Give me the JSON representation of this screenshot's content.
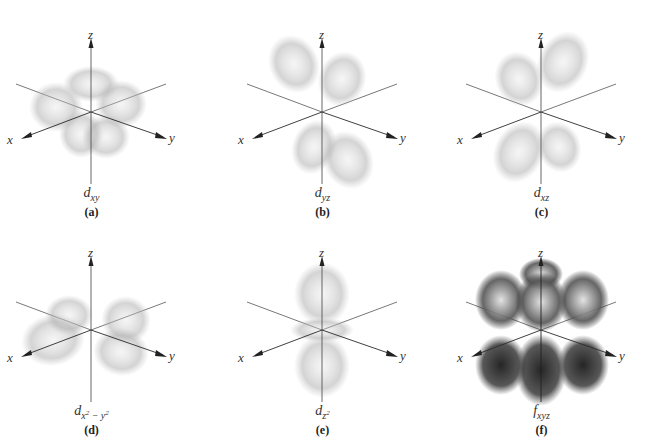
{
  "figure": {
    "axis_labels": {
      "x": "x",
      "y": "y",
      "z": "z"
    },
    "panels": [
      {
        "id": "a",
        "letter": "(a)",
        "orbital": "d",
        "sub": "xy",
        "sup": "",
        "sub2": "",
        "kind": "dxy",
        "col": 0,
        "row": 0
      },
      {
        "id": "b",
        "letter": "(b)",
        "orbital": "d",
        "sub": "yz",
        "sup": "",
        "sub2": "",
        "kind": "dyz",
        "col": 1,
        "row": 0
      },
      {
        "id": "c",
        "letter": "(c)",
        "orbital": "d",
        "sub": "xz",
        "sup": "",
        "sub2": "",
        "kind": "dxz",
        "col": 2,
        "row": 0
      },
      {
        "id": "d",
        "letter": "(d)",
        "orbital": "d",
        "sub": "x",
        "sup": "2",
        "sub2": " − y",
        "sup2": "2",
        "kind": "dx2y2",
        "col": 0,
        "row": 1
      },
      {
        "id": "e",
        "letter": "(e)",
        "orbital": "d",
        "sub": "z",
        "sup": "2",
        "sub2": "",
        "kind": "dz2",
        "col": 1,
        "row": 1
      },
      {
        "id": "f",
        "letter": "(f)",
        "orbital": "f",
        "sub": "xyz",
        "sup": "",
        "sub2": "",
        "kind": "fxyz",
        "col": 2,
        "row": 1
      }
    ],
    "colors": {
      "background": "#ffffff",
      "axis": "#555555",
      "axis_front": "#2a2a2a",
      "lobe_light": "#b8b8b8",
      "lobe_dark": "#2e2e2e",
      "text": "#333333"
    }
  }
}
